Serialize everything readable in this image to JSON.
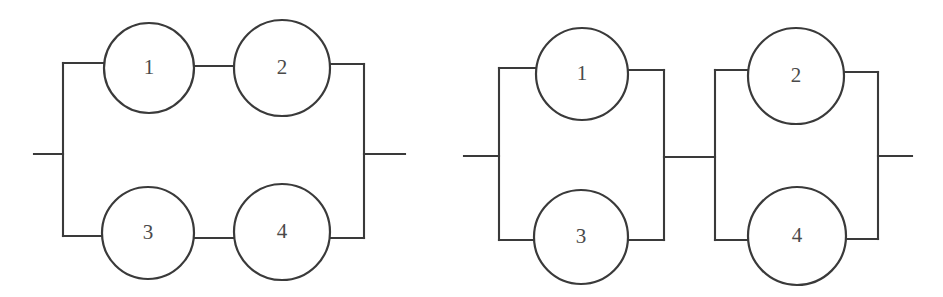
{
  "figure": {
    "type": "reliability-block-diagram-pair",
    "background_color": "#ffffff",
    "line_color": "#3a3a3a",
    "label_color": "#4a4a4a",
    "fill_color": "#ffffff",
    "width": 943,
    "height": 297
  },
  "diagrams": [
    {
      "id": "left",
      "name": "series-parallel-diagram-left",
      "description": "Two parallel branches, each with two blocks in series",
      "blocks": [
        {
          "label": "1",
          "cx": 149,
          "cy": 68,
          "r": 45
        },
        {
          "label": "2",
          "cx": 282,
          "cy": 68,
          "r": 48
        },
        {
          "label": "3",
          "cx": 148,
          "cy": 233,
          "r": 46
        },
        {
          "label": "4",
          "cx": 282,
          "cy": 232,
          "r": 48
        }
      ],
      "wires": [
        {
          "name": "input-lead",
          "points": "34,154 63,154"
        },
        {
          "name": "left-bus",
          "points": "63,63 63,236"
        },
        {
          "name": "top-left-branch",
          "points": "63,63 105,63"
        },
        {
          "name": "top-series-link",
          "points": "193,66 235,66"
        },
        {
          "name": "top-right-branch",
          "points": "329,64 364,64"
        },
        {
          "name": "right-bus",
          "points": "364,64 364,238"
        },
        {
          "name": "bottom-left-branch",
          "points": "63,236 103,236"
        },
        {
          "name": "bottom-series-link",
          "points": "194,238 235,238"
        },
        {
          "name": "bottom-right-branch",
          "points": "330,238 364,238"
        },
        {
          "name": "output-lead",
          "points": "364,154 405,154"
        }
      ]
    },
    {
      "id": "right",
      "name": "parallel-series-diagram-right",
      "description": "Two parallel groups connected in series",
      "blocks": [
        {
          "label": "1",
          "cx": 582,
          "cy": 74,
          "r": 46
        },
        {
          "label": "2",
          "cx": 796,
          "cy": 76,
          "r": 48
        },
        {
          "label": "3",
          "cx": 581,
          "cy": 237,
          "r": 47
        },
        {
          "label": "4",
          "cx": 797,
          "cy": 236,
          "r": 49
        }
      ],
      "wires": [
        {
          "name": "input-lead",
          "points": "464,156 499,156"
        },
        {
          "name": "group1-left-bus",
          "points": "499,68 499,240"
        },
        {
          "name": "group1-top-left",
          "points": "499,68 538,68"
        },
        {
          "name": "group1-top-right",
          "points": "627,70 664,70"
        },
        {
          "name": "group1-right-bus",
          "points": "664,70 664,240"
        },
        {
          "name": "group1-bottom-left",
          "points": "499,240 536,240"
        },
        {
          "name": "group1-bottom-right",
          "points": "628,240 664,240"
        },
        {
          "name": "inter-group-link",
          "points": "664,157 715,157"
        },
        {
          "name": "group2-left-bus",
          "points": "715,70 715,240"
        },
        {
          "name": "group2-top-left",
          "points": "715,70 752,70"
        },
        {
          "name": "group2-top-right",
          "points": "843,72 878,72"
        },
        {
          "name": "group2-right-bus",
          "points": "878,72 878,239"
        },
        {
          "name": "group2-bottom-left",
          "points": "715,240 753,240"
        },
        {
          "name": "group2-bottom-right",
          "points": "845,239 878,239"
        },
        {
          "name": "output-lead",
          "points": "878,156 912,156"
        }
      ]
    }
  ]
}
